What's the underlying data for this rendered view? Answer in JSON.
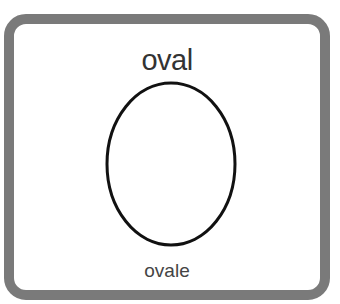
{
  "card": {
    "title": "oval",
    "caption": "ovale",
    "shape": "oval",
    "colors": {
      "border": "#7a7a7a",
      "stroke": "#111111",
      "background": "#ffffff"
    }
  }
}
